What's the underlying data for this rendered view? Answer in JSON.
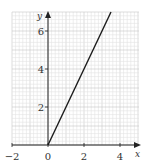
{
  "chart_data": {
    "type": "line",
    "title": "",
    "xlabel": "x",
    "ylabel": "y",
    "xlim": [
      -2,
      5
    ],
    "ylim": [
      0,
      7
    ],
    "x_ticks": [
      -2,
      0,
      2,
      4
    ],
    "y_ticks": [
      2,
      4,
      6
    ],
    "x_tick_labels": [
      "−2",
      "0",
      "2",
      "4"
    ],
    "y_tick_labels": [
      "2",
      "4",
      "6"
    ],
    "grid": true,
    "minor_grid_step": 0.2,
    "major_grid_step": 1,
    "series": [
      {
        "name": "y = 2x",
        "x": [
          0,
          3.5
        ],
        "y": [
          0,
          7
        ],
        "color": "#1a1a1a"
      }
    ],
    "legend": null
  },
  "colors": {
    "minor_grid": "#e2e2e2",
    "major_grid": "#c8c8c8",
    "axis": "#222222",
    "line": "#1a1a1a",
    "text": "#333333"
  }
}
